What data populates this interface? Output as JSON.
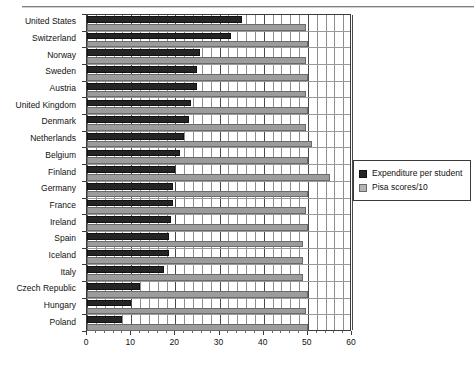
{
  "chart_data": {
    "type": "bar",
    "orientation": "horizontal",
    "title": "",
    "xlabel": "",
    "ylabel": "",
    "xlim": [
      0,
      60
    ],
    "xticks": [
      0,
      10,
      20,
      30,
      40,
      50,
      60
    ],
    "xtick_labels": [
      "0",
      "10",
      "20",
      "30",
      "40",
      "50",
      "60"
    ],
    "minor_tick_step": 2,
    "grid": true,
    "legend_position": "right",
    "categories": [
      "United States",
      "Switzerland",
      "Norway",
      "Sweden",
      "Austria",
      "United Kingdom",
      "Denmark",
      "Netherlands",
      "Belgium",
      "Finland",
      "Germany",
      "France",
      "Ireland",
      "Spain",
      "Iceland",
      "Italy",
      "Czech Republic",
      "Hungary",
      "Poland"
    ],
    "series": [
      {
        "name": "Expenditure per student",
        "color": "#242424",
        "values": [
          35,
          32.5,
          25.5,
          25,
          25,
          23.5,
          23,
          22,
          21,
          20,
          19.5,
          19.5,
          19,
          18.5,
          18.5,
          17.5,
          12,
          10,
          8
        ]
      },
      {
        "name": "Pisa scores/10",
        "color": "#9c9c9c",
        "values": [
          49.5,
          50,
          49.5,
          50,
          49.5,
          50,
          49.5,
          51,
          50,
          55,
          50,
          49.5,
          50,
          49,
          49,
          49,
          50,
          49.5,
          50
        ]
      }
    ]
  },
  "legend": {
    "items": [
      {
        "label": "Expenditure per student",
        "swatch": "dark"
      },
      {
        "label": "Pisa scores/10",
        "swatch": "light"
      }
    ]
  }
}
